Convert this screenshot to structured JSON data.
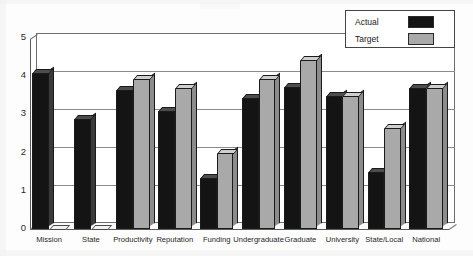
{
  "chart_data": {
    "type": "bar",
    "title": "",
    "subtitle": "",
    "xlabel": "",
    "ylabel": "",
    "ylim": [
      0,
      5
    ],
    "yticks": [
      "0",
      "1",
      "2",
      "3",
      "4",
      "5"
    ],
    "grid": true,
    "legend_position": "top-right",
    "style": "3d-clustered-bar",
    "categories": [
      "Mission",
      "State",
      "Productivity",
      "Reputation",
      "Funding",
      "Undergraduate",
      "Graduate",
      "University",
      "State/Local",
      "National"
    ],
    "series": [
      {
        "name": "Actual",
        "color": "#141414",
        "values": [
          4.1,
          2.9,
          3.65,
          3.1,
          1.35,
          3.45,
          3.75,
          3.5,
          1.5,
          3.7
        ]
      },
      {
        "name": "Target",
        "color": "#a9a9a9",
        "values": [
          0,
          0,
          3.95,
          3.7,
          2.0,
          3.95,
          4.45,
          3.5,
          2.65,
          3.7
        ]
      }
    ]
  },
  "legend": {
    "entries": [
      {
        "label": "Actual",
        "color": "#141414"
      },
      {
        "label": "Target",
        "color": "#a9a9a9"
      }
    ]
  },
  "colors": {
    "actual": "#141414",
    "target": "#a9a9a9",
    "axis": "#5a5a5a",
    "grid": "#8a8a8a",
    "background": "#fdfdfd"
  }
}
